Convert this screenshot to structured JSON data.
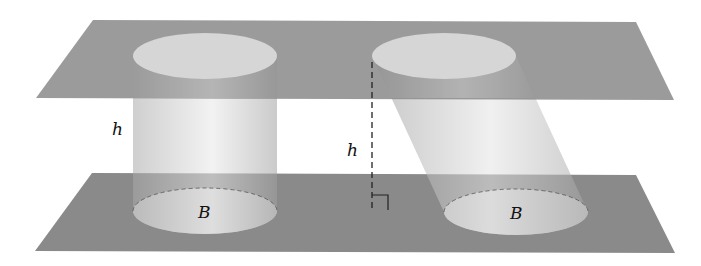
{
  "diagram": {
    "colors": {
      "plane": "#8a8a8a",
      "ellipse": "#d4d4d4",
      "cylinder_dark": "#9c9c9c",
      "cylinder_light": "#e6e6e6",
      "line": "#222222",
      "background": "#ffffff"
    },
    "labels": {
      "left_height": "h",
      "left_base": "B",
      "right_height": "h",
      "right_base": "B"
    },
    "shapes": [
      {
        "id": "top-plane",
        "type": "parallelogram"
      },
      {
        "id": "bottom-plane",
        "type": "parallelogram"
      },
      {
        "id": "right-cylinder",
        "type": "cylinder",
        "orientation": "right"
      },
      {
        "id": "oblique-cylinder",
        "type": "cylinder",
        "orientation": "oblique"
      },
      {
        "id": "height-dashed-line",
        "type": "dashed-line"
      },
      {
        "id": "right-angle-mark",
        "type": "marker"
      }
    ]
  }
}
